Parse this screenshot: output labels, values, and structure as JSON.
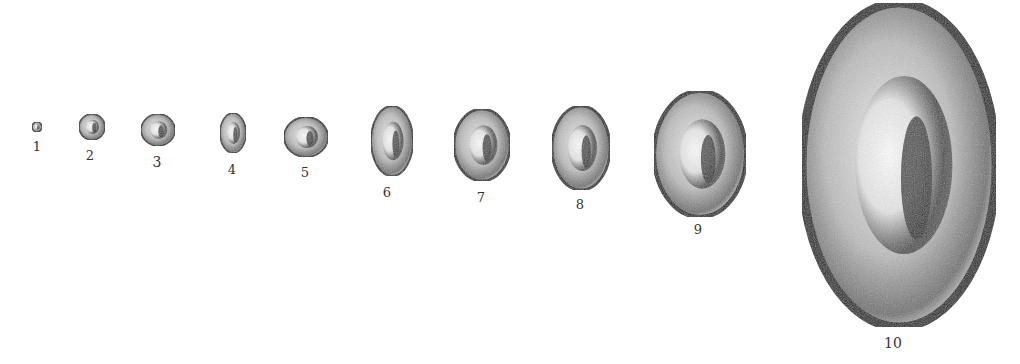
{
  "figure": {
    "colors": {
      "background": "#ffffff",
      "ink": "#1a1a1a",
      "mid": "#7a7a7a",
      "light": "#d9d9d9"
    },
    "cells": [
      {
        "label": "1",
        "cx": 37,
        "cy": 127,
        "rx": 5,
        "ry": 5,
        "lx": 37,
        "ly": 151,
        "fs": 13
      },
      {
        "label": "2",
        "cx": 92,
        "cy": 127,
        "rx": 13,
        "ry": 13,
        "lx": 90,
        "ly": 160,
        "fs": 13
      },
      {
        "label": "3",
        "cx": 158,
        "cy": 130,
        "rx": 17,
        "ry": 16,
        "lx": 157,
        "ly": 167,
        "fs": 14
      },
      {
        "label": "4",
        "cx": 233,
        "cy": 133,
        "rx": 13,
        "ry": 20,
        "lx": 232,
        "ly": 174,
        "fs": 13
      },
      {
        "label": "5",
        "cx": 306,
        "cy": 137,
        "rx": 22,
        "ry": 20,
        "lx": 305,
        "ly": 177,
        "fs": 13
      },
      {
        "label": "6",
        "cx": 392,
        "cy": 141,
        "rx": 21,
        "ry": 35,
        "lx": 387,
        "ly": 197,
        "fs": 13
      },
      {
        "label": "7",
        "cx": 482,
        "cy": 145,
        "rx": 28,
        "ry": 36,
        "lx": 481,
        "ly": 202,
        "fs": 13
      },
      {
        "label": "8",
        "cx": 581,
        "cy": 148,
        "rx": 29,
        "ry": 42,
        "lx": 580,
        "ly": 209,
        "fs": 13
      },
      {
        "label": "9",
        "cx": 700,
        "cy": 154,
        "rx": 46,
        "ry": 63,
        "lx": 698,
        "ly": 234,
        "fs": 13
      },
      {
        "label": "10",
        "cx": 899,
        "cy": 165,
        "rx": 97,
        "ry": 162,
        "lx": 893,
        "ly": 348,
        "fs": 14
      }
    ]
  }
}
